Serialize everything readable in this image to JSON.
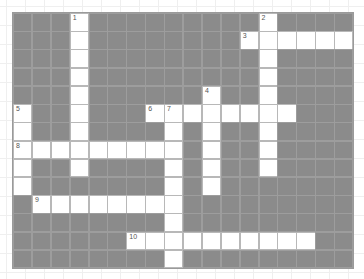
{
  "puzzle": {
    "title": "",
    "cols": 18,
    "rows": 14,
    "colors": {
      "block": "#8b8b8b",
      "open": "#ffffff",
      "number": "#555555"
    },
    "entries": [
      {
        "number": 1,
        "direction": "down",
        "row": 0,
        "col": 3,
        "length": 9
      },
      {
        "number": 2,
        "direction": "down",
        "row": 0,
        "col": 13,
        "length": 9
      },
      {
        "number": 3,
        "direction": "across",
        "row": 1,
        "col": 12,
        "length": 6
      },
      {
        "number": 4,
        "direction": "down",
        "row": 4,
        "col": 10,
        "length": 6
      },
      {
        "number": 5,
        "direction": "down",
        "row": 5,
        "col": 0,
        "length": 5
      },
      {
        "number": 6,
        "direction": "across",
        "row": 5,
        "col": 7,
        "length": 8
      },
      {
        "number": 7,
        "direction": "down",
        "row": 5,
        "col": 8,
        "length": 9
      },
      {
        "number": 8,
        "direction": "across",
        "row": 7,
        "col": 0,
        "length": 9
      },
      {
        "number": 9,
        "direction": "across",
        "row": 10,
        "col": 1,
        "length": 8
      },
      {
        "number": 10,
        "direction": "across",
        "row": 12,
        "col": 6,
        "length": 10
      }
    ]
  }
}
